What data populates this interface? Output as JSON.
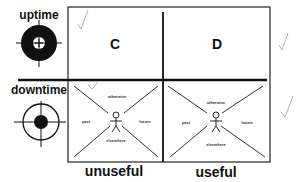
{
  "rows": [
    {
      "label": "uptime",
      "icon": "target-ring-icon"
    },
    {
      "label": "downtime",
      "icon": "target-bullseye-icon"
    }
  ],
  "columns": [
    {
      "label": "unuseful"
    },
    {
      "label": "useful"
    }
  ],
  "quadrants": {
    "top_left": {
      "letter": "C"
    },
    "top_right": {
      "letter": "D"
    },
    "bottom_left": {
      "labels": {
        "top": "otherwise",
        "left": "past",
        "right": "future",
        "bottom": "elsewhere"
      }
    },
    "bottom_right": {
      "labels": {
        "top": "otherwise",
        "left": "past",
        "right": "future",
        "bottom": "elsewhere"
      }
    }
  },
  "marks": [
    "check-mark",
    "check-mark",
    "check-mark",
    "check-mark"
  ],
  "colors": {
    "ink": "#111111",
    "pencil": "#aaaaaa"
  }
}
